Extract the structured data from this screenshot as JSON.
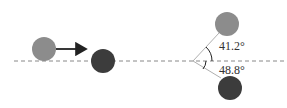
{
  "diagram": {
    "before": {
      "incoming_ball": {
        "color": "#8c8c8c",
        "cx": 44,
        "cy": 49,
        "r": 12
      },
      "target_ball": {
        "color": "#3c3c3c",
        "cx": 103,
        "cy": 61,
        "r": 12
      },
      "velocity_arrow": {
        "x1": 56,
        "y1": 49,
        "x2": 88,
        "y2": 49
      }
    },
    "after": {
      "vertex": {
        "x": 193,
        "y": 61
      },
      "upper_ball": {
        "color": "#8c8c8c",
        "cx": 227,
        "cy": 24,
        "r": 12
      },
      "lower_ball": {
        "color": "#3c3c3c",
        "cx": 230,
        "cy": 88,
        "r": 12
      },
      "upper_angle_label": "41.2°",
      "lower_angle_label": "48.8°"
    },
    "axis_line": {
      "y": 61,
      "style": "dashed"
    }
  }
}
